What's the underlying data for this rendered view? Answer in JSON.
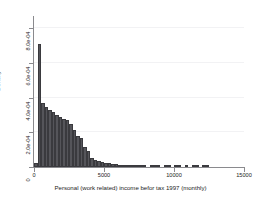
{
  "chart_data": {
    "type": "bar",
    "subtype": "histogram",
    "title": "",
    "xlabel": "Personal (work related) income befor tax 1997 (monthly)",
    "ylabel": "Density",
    "xlim": [
      0,
      15000
    ],
    "ylim": [
      0,
      0.00086
    ],
    "xticks": [
      0,
      5000,
      10000,
      15000
    ],
    "xtick_labels": [
      "0",
      "5000",
      "10000",
      "15000"
    ],
    "yticks": [
      0,
      0.0002,
      0.0004,
      0.0006,
      0.0008
    ],
    "ytick_labels": [
      "0",
      "2.0e-04",
      "4.0e-04",
      "6.0e-04",
      "8.0e-04"
    ],
    "grid": "horizontal-faint",
    "legend": null,
    "bar_color": "#55555a",
    "bar_edge_color": "#3a3a3e",
    "axis_color": "#8a8a8e",
    "bin_width": 250,
    "bins": [
      {
        "x0": 0,
        "x1": 250,
        "density": 2.5e-05
      },
      {
        "x0": 250,
        "x1": 500,
        "density": 0.00071
      },
      {
        "x0": 500,
        "x1": 750,
        "density": 0.00037
      },
      {
        "x0": 750,
        "x1": 1000,
        "density": 0.000345
      },
      {
        "x0": 1000,
        "x1": 1250,
        "density": 0.00033
      },
      {
        "x0": 1250,
        "x1": 1500,
        "density": 0.000315
      },
      {
        "x0": 1500,
        "x1": 1750,
        "density": 0.0003
      },
      {
        "x0": 1750,
        "x1": 2000,
        "density": 0.00029
      },
      {
        "x0": 2000,
        "x1": 2250,
        "density": 0.00028
      },
      {
        "x0": 2250,
        "x1": 2500,
        "density": 0.00027
      },
      {
        "x0": 2500,
        "x1": 2750,
        "density": 0.00025
      },
      {
        "x0": 2750,
        "x1": 3000,
        "density": 0.000215
      },
      {
        "x0": 3000,
        "x1": 3250,
        "density": 0.00018
      },
      {
        "x0": 3250,
        "x1": 3500,
        "density": 0.00017
      },
      {
        "x0": 3500,
        "x1": 3750,
        "density": 0.000115
      },
      {
        "x0": 3750,
        "x1": 4000,
        "density": 9.5e-05
      },
      {
        "x0": 4000,
        "x1": 4250,
        "density": 5e-05
      },
      {
        "x0": 4250,
        "x1": 4500,
        "density": 4.2e-05
      },
      {
        "x0": 4500,
        "x1": 4750,
        "density": 3.3e-05
      },
      {
        "x0": 4750,
        "x1": 5000,
        "density": 3e-05
      },
      {
        "x0": 5000,
        "x1": 5250,
        "density": 2.6e-05
      },
      {
        "x0": 5250,
        "x1": 5500,
        "density": 2.1e-05
      },
      {
        "x0": 5500,
        "x1": 5750,
        "density": 1.7e-05
      },
      {
        "x0": 5750,
        "x1": 6000,
        "density": 1.5e-05
      },
      {
        "x0": 6000,
        "x1": 6250,
        "density": 1.2e-05
      },
      {
        "x0": 6250,
        "x1": 6500,
        "density": 9.5e-06
      },
      {
        "x0": 6500,
        "x1": 6750,
        "density": 6e-06
      },
      {
        "x0": 6750,
        "x1": 7000,
        "density": 5.5e-06
      },
      {
        "x0": 7000,
        "x1": 7250,
        "density": 4.5e-06
      },
      {
        "x0": 7250,
        "x1": 7500,
        "density": 4e-06
      },
      {
        "x0": 7500,
        "x1": 7750,
        "density": 4e-06
      },
      {
        "x0": 7750,
        "x1": 8000,
        "density": 3.5e-06
      },
      {
        "x0": 8000,
        "x1": 8250,
        "density": 0.0
      },
      {
        "x0": 8250,
        "x1": 8500,
        "density": 3.5e-06
      },
      {
        "x0": 8500,
        "x1": 8750,
        "density": 3.5e-06
      },
      {
        "x0": 8750,
        "x1": 9000,
        "density": 3e-06
      },
      {
        "x0": 9000,
        "x1": 9250,
        "density": 0.0
      },
      {
        "x0": 9250,
        "x1": 9500,
        "density": 3e-06
      },
      {
        "x0": 9500,
        "x1": 9750,
        "density": 3e-06
      },
      {
        "x0": 9750,
        "x1": 10000,
        "density": 0.0
      },
      {
        "x0": 10000,
        "x1": 10250,
        "density": 3e-06
      },
      {
        "x0": 10250,
        "x1": 10500,
        "density": 3e-06
      },
      {
        "x0": 10500,
        "x1": 10750,
        "density": 0.0
      },
      {
        "x0": 10750,
        "x1": 11000,
        "density": 3e-06
      },
      {
        "x0": 11000,
        "x1": 11250,
        "density": 0.0
      },
      {
        "x0": 11250,
        "x1": 11500,
        "density": 3e-06
      },
      {
        "x0": 11500,
        "x1": 11750,
        "density": 3e-06
      },
      {
        "x0": 11750,
        "x1": 12000,
        "density": 0.0
      },
      {
        "x0": 12000,
        "x1": 12250,
        "density": 3e-06
      },
      {
        "x0": 12250,
        "x1": 12500,
        "density": 3e-06
      }
    ]
  }
}
